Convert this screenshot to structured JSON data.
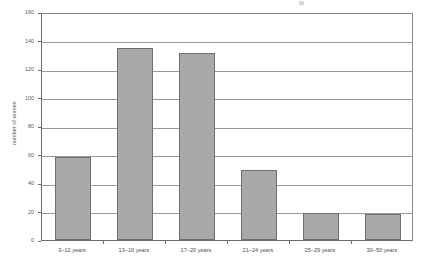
{
  "chart_data": {
    "type": "bar",
    "title": "",
    "xlabel": "",
    "ylabel": "number of women",
    "categories": [
      "3–12 years",
      "13–16 years",
      "17–20 years",
      "21–24 years",
      "25–29 years",
      "30–50 years"
    ],
    "values": [
      58,
      135,
      131,
      49,
      19,
      18
    ],
    "series": [
      {
        "name": "number of women",
        "values": [
          58,
          135,
          131,
          49,
          19,
          18
        ]
      }
    ],
    "ylim": [
      0,
      160
    ],
    "yticks": [
      0,
      20,
      40,
      60,
      80,
      100,
      120,
      140,
      160
    ],
    "ytick_labels": [
      "0",
      "20",
      "40",
      "60",
      "80",
      "100",
      "120",
      "140",
      "160"
    ],
    "grid": true,
    "grid_axis": "y",
    "legend": false,
    "legend_position": "none",
    "bar_fill_color": "#a9a9a9",
    "bar_edge_color": "#6e6e6e",
    "gridline_color": "#9a9a9a",
    "axis_color": "#6b6b6b",
    "background_color": "#ffffff"
  }
}
